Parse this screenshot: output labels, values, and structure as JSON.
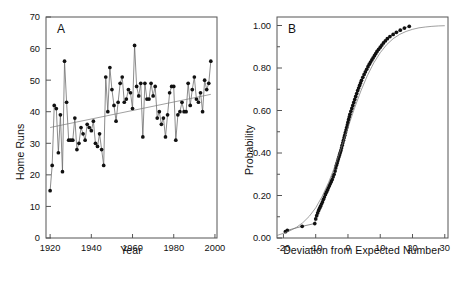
{
  "figure": {
    "background": "#ffffff",
    "width": 463,
    "height": 288,
    "marker_color": "#111111",
    "line_color": "#666666",
    "axis_color": "#555555"
  },
  "chart_data": [
    {
      "type": "line",
      "panel_label": "A",
      "title": "",
      "xlabel": "Year",
      "ylabel": "Home Runs",
      "xlim": [
        1918,
        2001
      ],
      "ylim": [
        0,
        70
      ],
      "xticks": [
        1920,
        1940,
        1960,
        1980,
        2000
      ],
      "xticklabels": [
        "1920",
        "1940",
        "1960",
        "1980",
        "2000"
      ],
      "yticks": [
        0,
        10,
        20,
        30,
        40,
        50,
        60,
        70
      ],
      "yticklabels": [
        "0",
        "10",
        "20",
        "30",
        "40",
        "50",
        "60",
        "70"
      ],
      "grid": false,
      "legend": null,
      "markers": "filled-circle",
      "series": [
        {
          "name": "Home run leader total",
          "x": [
            1920,
            1921,
            1922,
            1923,
            1924,
            1925,
            1926,
            1927,
            1928,
            1929,
            1930,
            1931,
            1932,
            1933,
            1934,
            1935,
            1936,
            1937,
            1938,
            1939,
            1940,
            1941,
            1942,
            1943,
            1944,
            1945,
            1946,
            1947,
            1948,
            1949,
            1950,
            1951,
            1952,
            1953,
            1954,
            1955,
            1956,
            1957,
            1958,
            1959,
            1960,
            1961,
            1962,
            1963,
            1964,
            1965,
            1966,
            1967,
            1968,
            1969,
            1970,
            1971,
            1972,
            1973,
            1974,
            1975,
            1976,
            1977,
            1978,
            1979,
            1980,
            1981,
            1982,
            1983,
            1984,
            1985,
            1986,
            1987,
            1988,
            1989,
            1990,
            1991,
            1992,
            1993,
            1994,
            1995,
            1996,
            1997,
            1998
          ],
          "values": [
            15,
            23,
            42,
            41,
            27,
            39,
            21,
            56,
            43,
            31,
            31,
            31,
            38,
            28,
            30,
            35,
            33,
            31,
            36,
            35,
            34,
            37,
            30,
            29,
            33,
            28,
            23,
            51,
            40,
            54,
            47,
            42,
            37,
            43,
            49,
            51,
            43,
            44,
            47,
            46,
            41,
            61,
            48,
            45,
            49,
            32,
            49,
            44,
            44,
            49,
            45,
            48,
            38,
            40,
            36,
            38,
            32,
            39,
            46,
            48,
            48,
            31,
            39,
            40,
            43,
            40,
            40,
            49,
            42,
            47,
            51,
            44,
            43,
            46,
            40,
            50,
            47,
            49,
            56
          ],
          "marker": "filled-circle"
        },
        {
          "name": "Linear trend",
          "x": [
            1920,
            1998
          ],
          "values": [
            35.0,
            45.5
          ],
          "marker": "none",
          "style": "solid-thin"
        }
      ]
    },
    {
      "type": "scatter",
      "panel_label": "B",
      "title": "",
      "xlabel": "Deviation from Expected Number",
      "ylabel": "Probability",
      "xlim": [
        -22,
        31
      ],
      "ylim": [
        0.0,
        1.04
      ],
      "xticks": [
        -20,
        -10,
        0,
        10,
        20,
        30
      ],
      "xticklabels": [
        "-20",
        "-10",
        "0",
        "10",
        "20",
        "30"
      ],
      "yticks": [
        0.0,
        0.2,
        0.4,
        0.6,
        0.8,
        1.0
      ],
      "yticklabels": [
        "0.00",
        "0.20",
        "0.40",
        "0.60",
        "0.80",
        "1.00"
      ],
      "minor_yticks": [
        0.1,
        0.3,
        0.5,
        0.7,
        0.9
      ],
      "grid": false,
      "legend": null,
      "markers": "filled-circle",
      "series": [
        {
          "name": "Empirical cumulative probability",
          "x": [
            -19.4,
            -18.8,
            -14.2,
            -10.3,
            -10.0,
            -9.7,
            -9.4,
            -9.1,
            -8.8,
            -8.5,
            -8.2,
            -7.9,
            -7.6,
            -7.3,
            -7.0,
            -6.7,
            -6.4,
            -6.1,
            -5.8,
            -5.5,
            -5.2,
            -4.9,
            -4.6,
            -4.3,
            -4.0,
            -3.8,
            -3.6,
            -3.4,
            -3.2,
            -3.0,
            -2.8,
            -2.6,
            -2.4,
            -2.2,
            -2.0,
            -1.8,
            -1.6,
            -1.4,
            -1.2,
            -1.0,
            -0.8,
            -0.6,
            -0.4,
            -0.2,
            0.0,
            0.2,
            0.4,
            0.6,
            0.9,
            1.2,
            1.5,
            1.8,
            2.1,
            2.4,
            2.7,
            3.0,
            3.3,
            3.6,
            3.9,
            4.2,
            4.6,
            5.0,
            5.4,
            5.8,
            6.2,
            6.6,
            7.0,
            7.4,
            7.8,
            8.2,
            8.6,
            9.0,
            9.5,
            10.0,
            10.5,
            11.0,
            11.6,
            12.2,
            13.0,
            14.0,
            15.0,
            16.2,
            17.5,
            19.0
          ],
          "values": [
            0.03,
            0.036,
            0.055,
            0.068,
            0.09,
            0.105,
            0.118,
            0.13,
            0.14,
            0.15,
            0.16,
            0.17,
            0.182,
            0.193,
            0.205,
            0.215,
            0.225,
            0.235,
            0.245,
            0.255,
            0.265,
            0.275,
            0.288,
            0.3,
            0.315,
            0.33,
            0.342,
            0.352,
            0.362,
            0.372,
            0.382,
            0.392,
            0.402,
            0.412,
            0.424,
            0.436,
            0.448,
            0.46,
            0.472,
            0.484,
            0.496,
            0.508,
            0.52,
            0.532,
            0.545,
            0.558,
            0.57,
            0.582,
            0.596,
            0.61,
            0.624,
            0.638,
            0.652,
            0.666,
            0.68,
            0.694,
            0.706,
            0.718,
            0.73,
            0.742,
            0.756,
            0.77,
            0.782,
            0.794,
            0.806,
            0.818,
            0.828,
            0.838,
            0.848,
            0.858,
            0.868,
            0.878,
            0.888,
            0.898,
            0.908,
            0.918,
            0.928,
            0.938,
            0.948,
            0.958,
            0.968,
            0.978,
            0.988,
            0.996
          ],
          "marker": "filled-circle"
        },
        {
          "name": "Fitted logistic curve",
          "x": [
            -22,
            -20,
            -18,
            -16,
            -14,
            -12,
            -10,
            -8,
            -6,
            -4,
            -2,
            0,
            2,
            4,
            6,
            8,
            10,
            12,
            14,
            16,
            18,
            20,
            22,
            24,
            26,
            28,
            30
          ],
          "values": [
            0.012,
            0.022,
            0.034,
            0.05,
            0.072,
            0.102,
            0.142,
            0.196,
            0.262,
            0.34,
            0.428,
            0.52,
            0.61,
            0.692,
            0.764,
            0.824,
            0.872,
            0.91,
            0.938,
            0.958,
            0.972,
            0.982,
            0.989,
            0.993,
            0.996,
            0.998,
            0.999
          ],
          "marker": "none",
          "style": "solid-thin"
        }
      ]
    }
  ]
}
